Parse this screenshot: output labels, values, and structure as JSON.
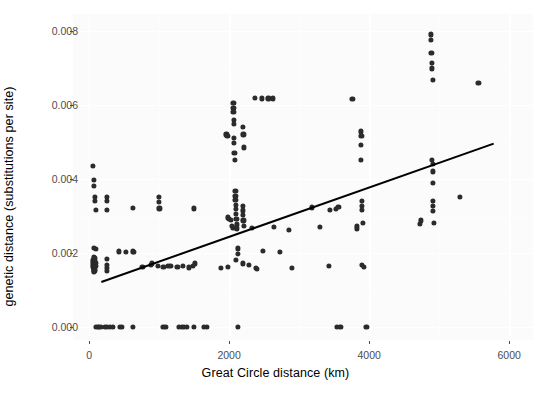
{
  "chart_data": {
    "type": "scatter",
    "title": "",
    "xlabel": "Great Circle distance (km)",
    "ylabel": "genetic distance (substitutions per site)",
    "xlim": [
      -230,
      6340
    ],
    "ylim": [
      -0.00035,
      0.00845
    ],
    "xticks": [
      0,
      2000,
      4000,
      6000
    ],
    "xticklabels": [
      "0",
      "2000",
      "4000",
      "6000"
    ],
    "yticks": [
      0.0,
      0.002,
      0.004,
      0.006,
      0.008
    ],
    "yticklabels": [
      "0.000",
      "0.002",
      "0.004",
      "0.006",
      "0.008"
    ],
    "grid": true,
    "legend": null,
    "point_color": "#2b2b2b",
    "panel_color": "#fbfbfb",
    "grid_color": "#ffffff",
    "trendline": {
      "type": "linear-fit",
      "color": "#000000",
      "x_start": 170,
      "y_start": 0.00123,
      "x_end": 5770,
      "y_end": 0.00496
    },
    "points": [
      [
        60,
        0.00435
      ],
      [
        70,
        0.00398
      ],
      [
        70,
        0.00381
      ],
      [
        80,
        0.00352
      ],
      [
        80,
        0.0034
      ],
      [
        95,
        0.00316
      ],
      [
        250,
        0.00352
      ],
      [
        250,
        0.0034
      ],
      [
        255,
        0.00316
      ],
      [
        620,
        0.00322
      ],
      [
        1000,
        0.00352
      ],
      [
        1000,
        0.00338
      ],
      [
        1005,
        0.0032
      ],
      [
        70,
        0.00213
      ],
      [
        95,
        0.00211
      ],
      [
        60,
        0.0018
      ],
      [
        60,
        0.00174
      ],
      [
        62,
        0.00168
      ],
      [
        62,
        0.00162
      ],
      [
        64,
        0.0019
      ],
      [
        64,
        0.00184
      ],
      [
        66,
        0.00156
      ],
      [
        66,
        0.0015
      ],
      [
        68,
        0.00178
      ],
      [
        68,
        0.00166
      ],
      [
        70,
        0.00158
      ],
      [
        72,
        0.00172
      ],
      [
        74,
        0.00162
      ],
      [
        76,
        0.00152
      ],
      [
        78,
        0.00186
      ],
      [
        80,
        0.00176
      ],
      [
        82,
        0.0016
      ],
      [
        84,
        0.0017
      ],
      [
        86,
        0.00182
      ],
      [
        88,
        0.00154
      ],
      [
        90,
        0.00164
      ],
      [
        92,
        0.00174
      ],
      [
        250,
        0.00183
      ],
      [
        255,
        0.00168
      ],
      [
        258,
        0.0016
      ],
      [
        260,
        0.00152
      ],
      [
        430,
        0.00204
      ],
      [
        520,
        0.00202
      ],
      [
        620,
        0.00204
      ],
      [
        640,
        0.00203
      ],
      [
        760,
        0.00163
      ],
      [
        880,
        0.00167
      ],
      [
        900,
        0.00172
      ],
      [
        980,
        0.00165
      ],
      [
        1060,
        0.00162
      ],
      [
        1120,
        0.00166
      ],
      [
        1160,
        0.00164
      ],
      [
        1260,
        0.00162
      ],
      [
        1340,
        0.00166
      ],
      [
        1420,
        0.00161
      ],
      [
        1480,
        0.00164
      ],
      [
        1500,
        0.0032
      ],
      [
        1510,
        0.00172
      ],
      [
        1880,
        0.0016
      ],
      [
        1980,
        0.00163
      ],
      [
        2060,
        0.00605
      ],
      [
        2060,
        0.00592
      ],
      [
        2060,
        0.0058
      ],
      [
        2065,
        0.0056
      ],
      [
        2065,
        0.00548
      ],
      [
        2070,
        0.0051
      ],
      [
        2070,
        0.00497
      ],
      [
        2075,
        0.0047
      ],
      [
        2080,
        0.00452
      ],
      [
        2090,
        0.00368
      ],
      [
        2090,
        0.00355
      ],
      [
        2090,
        0.00343
      ],
      [
        2100,
        0.0033
      ],
      [
        2100,
        0.00318
      ],
      [
        2100,
        0.00306
      ],
      [
        2105,
        0.00292
      ],
      [
        2110,
        0.00277
      ],
      [
        2115,
        0.00266
      ],
      [
        1980,
        0.00296
      ],
      [
        2000,
        0.00292
      ],
      [
        2020,
        0.0029
      ],
      [
        2040,
        0.00272
      ],
      [
        2060,
        0.00268
      ],
      [
        1960,
        0.0052
      ],
      [
        1975,
        0.00515
      ],
      [
        2200,
        0.0054
      ],
      [
        2205,
        0.0052
      ],
      [
        2210,
        0.00485
      ],
      [
        2200,
        0.00328
      ],
      [
        2200,
        0.00315
      ],
      [
        2200,
        0.00302
      ],
      [
        2205,
        0.00288
      ],
      [
        2210,
        0.00274
      ],
      [
        2120,
        0.00212
      ],
      [
        2125,
        0.00198
      ],
      [
        2100,
        0.00182
      ],
      [
        2330,
        0.00268
      ],
      [
        2370,
        0.00618
      ],
      [
        2470,
        0.00617
      ],
      [
        2560,
        0.00617
      ],
      [
        2200,
        0.00172
      ],
      [
        2280,
        0.00167
      ],
      [
        2380,
        0.0016
      ],
      [
        2400,
        0.00158
      ],
      [
        2620,
        0.00617
      ],
      [
        2480,
        0.00206
      ],
      [
        2640,
        0.0027
      ],
      [
        2850,
        0.00262
      ],
      [
        2720,
        0.00203
      ],
      [
        2900,
        0.0016
      ],
      [
        3180,
        0.00323
      ],
      [
        3440,
        0.00317
      ],
      [
        3520,
        0.00318
      ],
      [
        3560,
        0.00324
      ],
      [
        3300,
        0.0027
      ],
      [
        3760,
        0.00615
      ],
      [
        3880,
        0.00528
      ],
      [
        3890,
        0.00516
      ],
      [
        3880,
        0.00492
      ],
      [
        3880,
        0.00452
      ],
      [
        3820,
        0.00272
      ],
      [
        3830,
        0.00266
      ],
      [
        3900,
        0.0034
      ],
      [
        3900,
        0.00328
      ],
      [
        3900,
        0.00316
      ],
      [
        3910,
        0.00282
      ],
      [
        3900,
        0.00167
      ],
      [
        3920,
        0.00163
      ],
      [
        3420,
        0.00166
      ],
      [
        4880,
        0.0079
      ],
      [
        4885,
        0.00775
      ],
      [
        4890,
        0.0074
      ],
      [
        4895,
        0.00712
      ],
      [
        4900,
        0.00698
      ],
      [
        4905,
        0.00668
      ],
      [
        5560,
        0.0066
      ],
      [
        4900,
        0.00452
      ],
      [
        4905,
        0.0044
      ],
      [
        4905,
        0.0042
      ],
      [
        4910,
        0.0039
      ],
      [
        4915,
        0.0034
      ],
      [
        4915,
        0.00327
      ],
      [
        4915,
        0.00314
      ],
      [
        4920,
        0.00282
      ],
      [
        4740,
        0.00288
      ],
      [
        4730,
        0.00278
      ],
      [
        5300,
        0.00352
      ],
      [
        100,
        0.0
      ],
      [
        120,
        0.0
      ],
      [
        140,
        0.0
      ],
      [
        170,
        0.0
      ],
      [
        230,
        0.0
      ],
      [
        260,
        0.0
      ],
      [
        300,
        0.0
      ],
      [
        340,
        0.0
      ],
      [
        440,
        0.0
      ],
      [
        470,
        0.0
      ],
      [
        620,
        0.0
      ],
      [
        1050,
        0.0
      ],
      [
        1090,
        0.0
      ],
      [
        1280,
        0.0
      ],
      [
        1320,
        0.0
      ],
      [
        1355,
        0.0
      ],
      [
        1400,
        0.0
      ],
      [
        1500,
        0.0
      ],
      [
        1640,
        0.0
      ],
      [
        1680,
        0.0
      ],
      [
        2130,
        0.0
      ],
      [
        3540,
        0.0
      ],
      [
        3590,
        0.0
      ],
      [
        3960,
        0.0
      ]
    ]
  },
  "axes": {
    "x_title": "Great Circle distance (km)",
    "y_title": "genetic distance (substitutions per site)"
  }
}
